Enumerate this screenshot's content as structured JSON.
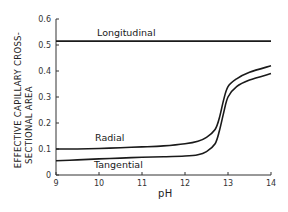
{
  "chart_data": {
    "type": "line",
    "title": "",
    "xlabel": "pH",
    "ylabel": [
      "EFFECTIVE CAPILLARY CROSS-",
      "SECTIONAL AREA"
    ],
    "xlim": [
      9,
      14
    ],
    "ylim": [
      0,
      0.6
    ],
    "x_ticks": [
      9,
      10,
      11,
      12,
      13,
      14
    ],
    "y_ticks": [
      0,
      0.1,
      0.2,
      0.3,
      0.4,
      0.5,
      0.6
    ],
    "x_tick_labels": [
      "9",
      "10",
      "11",
      "12",
      "13",
      "14"
    ],
    "y_tick_labels": [
      "0",
      "0.1",
      "0.2",
      "0.3",
      "0.4",
      "0.5",
      "0.6"
    ],
    "grid": false,
    "legend": "inline labels",
    "series": [
      {
        "name": "Longitudinal",
        "x": [
          9,
          10,
          11,
          12,
          13,
          14
        ],
        "values": [
          0.515,
          0.515,
          0.515,
          0.515,
          0.515,
          0.515
        ]
      },
      {
        "name": "Radial",
        "x": [
          9,
          9.5,
          10,
          10.5,
          11,
          11.5,
          12,
          12.3,
          12.5,
          12.7,
          12.8,
          12.9,
          13.0,
          13.2,
          13.5,
          14
        ],
        "values": [
          0.1,
          0.1,
          0.102,
          0.105,
          0.108,
          0.112,
          0.12,
          0.13,
          0.145,
          0.175,
          0.22,
          0.29,
          0.34,
          0.37,
          0.395,
          0.42
        ]
      },
      {
        "name": "Tangential",
        "x": [
          9,
          9.5,
          10,
          10.5,
          11,
          11.5,
          12,
          12.3,
          12.5,
          12.7,
          12.8,
          12.9,
          13.0,
          13.2,
          13.5,
          14
        ],
        "values": [
          0.055,
          0.058,
          0.062,
          0.065,
          0.068,
          0.07,
          0.073,
          0.078,
          0.09,
          0.12,
          0.17,
          0.24,
          0.3,
          0.34,
          0.365,
          0.39
        ]
      }
    ]
  },
  "labels": {
    "longitudinal": "Longitudinal",
    "radial": "Radial",
    "tangential": "Tangential",
    "xlabel": "pH",
    "ylabel_line1": "EFFECTIVE CAPILLARY CROSS-",
    "ylabel_line2": "SECTIONAL AREA"
  },
  "colors": {
    "line": "#1a1a1a",
    "axis": "#333333"
  }
}
